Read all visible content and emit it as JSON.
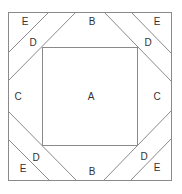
{
  "diagram": {
    "line_color": "#8a8a8a",
    "outer_square": {
      "x1": 8,
      "y1": 12,
      "x2": 171,
      "y2": 180
    },
    "inner_square": {
      "x1": 42,
      "y1": 47,
      "x2": 137,
      "y2": 145
    },
    "regions": {
      "center": {
        "label": "A"
      },
      "top": {
        "label": "B"
      },
      "bottom": {
        "label": "B"
      },
      "left": {
        "label": "C"
      },
      "right": {
        "label": "C"
      },
      "top_left_strip": {
        "label": "D"
      },
      "top_right_strip": {
        "label": "D"
      },
      "bottom_left_strip": {
        "label": "D"
      },
      "bottom_right_strip": {
        "label": "D"
      },
      "top_left_corner": {
        "label": "E"
      },
      "top_right_corner": {
        "label": "E"
      },
      "bottom_left_corner": {
        "label": "E"
      },
      "bottom_right_corner": {
        "label": "E"
      }
    }
  }
}
